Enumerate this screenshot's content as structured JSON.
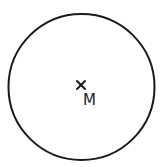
{
  "diagram": {
    "circle": {
      "cx": 81.5,
      "cy": 87,
      "r": 73,
      "stroke": "#1a1a1a"
    },
    "center_marker": {
      "symbol": "×",
      "x": 81,
      "y": 85
    },
    "center_label": "M"
  }
}
